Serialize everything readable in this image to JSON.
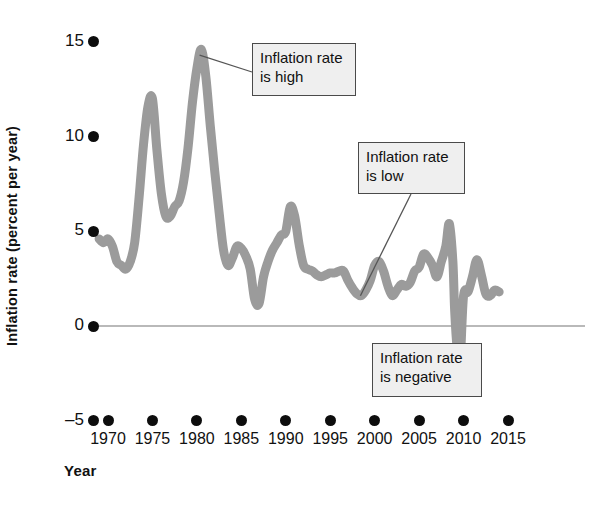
{
  "chart_data": {
    "type": "line",
    "title": "",
    "xlabel": "Year",
    "ylabel": "Inflation rate (percent per year)",
    "xlim": [
      1968,
      2016
    ],
    "ylim": [
      -5,
      16
    ],
    "xticks": [
      1970,
      1975,
      1980,
      1985,
      1990,
      1995,
      2000,
      2005,
      2010,
      2015
    ],
    "xtick_labels": [
      "1970",
      "1975",
      "1980",
      "1985",
      "1990",
      "1995",
      "2000",
      "2005",
      "2010",
      "2015"
    ],
    "yticks": [
      -5,
      0,
      5,
      10,
      15
    ],
    "ytick_labels": [
      "–5",
      "0",
      "5",
      "10",
      "15"
    ],
    "grid": false,
    "zero_line": true,
    "legend": "none",
    "series": [
      {
        "name": "Inflation rate",
        "color": "#9b9b9b",
        "x": [
          1969.0,
          1969.5,
          1970.0,
          1970.5,
          1971.0,
          1971.5,
          1972.0,
          1972.5,
          1973.0,
          1973.5,
          1974.0,
          1974.5,
          1975.0,
          1975.5,
          1976.0,
          1976.5,
          1977.0,
          1977.5,
          1978.0,
          1978.5,
          1979.0,
          1979.5,
          1980.0,
          1980.5,
          1981.0,
          1981.5,
          1982.0,
          1982.5,
          1983.0,
          1983.5,
          1984.0,
          1984.5,
          1985.0,
          1985.5,
          1986.0,
          1986.5,
          1987.0,
          1987.5,
          1988.0,
          1988.5,
          1989.0,
          1989.5,
          1990.0,
          1990.5,
          1991.0,
          1991.5,
          1992.0,
          1992.5,
          1993.0,
          1993.5,
          1994.0,
          1994.5,
          1995.0,
          1995.5,
          1996.0,
          1996.5,
          1997.0,
          1997.5,
          1998.0,
          1998.5,
          1999.0,
          1999.5,
          2000.0,
          2000.5,
          2001.0,
          2001.5,
          2002.0,
          2002.5,
          2003.0,
          2003.5,
          2004.0,
          2004.5,
          2005.0,
          2005.5,
          2006.0,
          2006.5,
          2007.0,
          2007.5,
          2008.0,
          2008.4,
          2008.8,
          2009.0,
          2009.3,
          2009.6,
          2010.0,
          2010.5,
          2011.0,
          2011.5,
          2012.0,
          2012.5,
          2013.0,
          2013.5,
          2014.0
        ],
        "y": [
          4.6,
          4.4,
          4.6,
          4.2,
          3.4,
          3.2,
          3.0,
          3.4,
          4.4,
          6.8,
          9.6,
          11.6,
          12.0,
          9.3,
          7.0,
          5.8,
          5.8,
          6.3,
          6.6,
          7.6,
          9.4,
          11.8,
          13.6,
          14.6,
          13.2,
          10.6,
          8.2,
          6.0,
          4.0,
          3.2,
          3.6,
          4.2,
          4.1,
          3.7,
          3.0,
          1.4,
          1.2,
          2.6,
          3.4,
          4.0,
          4.4,
          4.8,
          5.0,
          6.3,
          5.8,
          4.3,
          3.2,
          3.0,
          2.9,
          2.7,
          2.6,
          2.7,
          2.8,
          2.8,
          2.9,
          2.9,
          2.4,
          2.0,
          1.7,
          1.6,
          1.9,
          2.4,
          3.2,
          3.4,
          2.9,
          2.1,
          1.6,
          1.9,
          2.2,
          2.1,
          2.3,
          2.9,
          3.1,
          3.8,
          3.6,
          3.2,
          2.6,
          3.4,
          4.2,
          5.4,
          3.4,
          0.8,
          -1.3,
          -2.0,
          1.6,
          1.8,
          2.6,
          3.5,
          2.7,
          1.7,
          1.6,
          1.9,
          1.8
        ]
      }
    ],
    "annotations": [
      {
        "id": "high",
        "text": "Inflation rate\nis high",
        "points_at_year": 1980.3,
        "points_at_value": 14.3
      },
      {
        "id": "low",
        "text": "Inflation rate\nis low",
        "points_at_year": 1998.4,
        "points_at_value": 1.6
      },
      {
        "id": "negative",
        "text": "Inflation rate\nis negative",
        "points_at_year": 2009.3,
        "points_at_value": -1.4
      }
    ]
  }
}
